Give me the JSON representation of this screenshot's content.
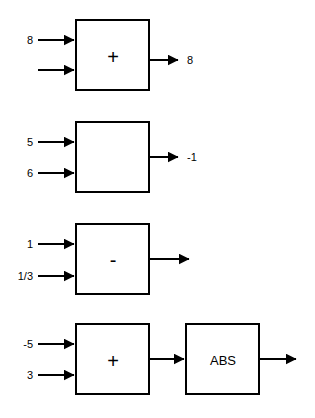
{
  "diagram": {
    "background_color": "#ffffff",
    "line_color": "#000000",
    "rows": [
      {
        "id": "row-1",
        "block": {
          "operator": "+",
          "name": "add-block"
        },
        "inputs": [
          {
            "label": "8"
          },
          {
            "label": ""
          }
        ],
        "output": {
          "label": "8"
        }
      },
      {
        "id": "row-2",
        "block": {
          "operator": "",
          "name": "blank-block"
        },
        "inputs": [
          {
            "label": "5"
          },
          {
            "label": "6"
          }
        ],
        "output": {
          "label": "-1"
        }
      },
      {
        "id": "row-3",
        "block": {
          "operator": "-",
          "name": "subtract-block"
        },
        "inputs": [
          {
            "label": "1"
          },
          {
            "label": "1/3"
          }
        ],
        "output": {
          "label": ""
        }
      },
      {
        "id": "row-4",
        "block": {
          "operator": "+",
          "name": "add-block"
        },
        "second_block": {
          "operator": "ABS",
          "name": "abs-block"
        },
        "inputs": [
          {
            "label": "-5"
          },
          {
            "label": "3"
          }
        ],
        "output": {
          "label": ""
        }
      }
    ]
  }
}
